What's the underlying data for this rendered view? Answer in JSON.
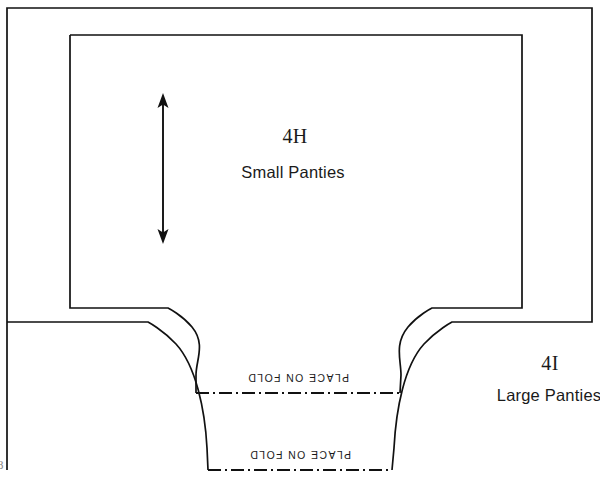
{
  "diagram": {
    "type": "sewing-pattern-layout",
    "background_color": "#ffffff",
    "line_color": "#111111",
    "pieces": [
      {
        "code": "4H",
        "name": "Small Panties",
        "outline_kind": "inner",
        "code_x": 295,
        "code_y": 126,
        "name_x": 293,
        "name_y": 164
      },
      {
        "code": "4I",
        "name": "Large Panties",
        "outline_kind": "outer",
        "code_x": 550,
        "code_y": 353,
        "name_x": 549,
        "name_y": 387
      }
    ],
    "fold_lines": [
      {
        "label": "PLACE ON FOLD",
        "belongs_to": "4H",
        "y": 393,
        "x_start": 196,
        "x_end": 400,
        "label_x": 298,
        "label_y": 372
      },
      {
        "label": "PLACE ON FOLD",
        "belongs_to": "4I",
        "y": 470,
        "x_start": 208,
        "x_end": 392,
        "label_x": 300,
        "label_y": 449
      }
    ],
    "grainline": {
      "name": "grainline-arrow",
      "x": 163,
      "y_top": 95,
      "y_bottom": 242,
      "double_headed": true
    },
    "page_number": "8"
  },
  "geometry": {
    "outer_piece": {
      "left": 7,
      "right": 592,
      "top": 8,
      "side_bottom": 322,
      "crotch_left": 208,
      "crotch_right": 392,
      "fold_y": 470
    },
    "inner_piece": {
      "left": 70,
      "right": 522,
      "top": 35,
      "side_bottom": 308,
      "crotch_left": 196,
      "crotch_right": 400,
      "fold_y": 393
    }
  }
}
